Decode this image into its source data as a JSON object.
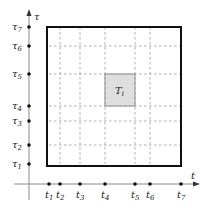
{
  "diagram": {
    "x_axis": {
      "label": "t",
      "ticks": [
        {
          "name": "t",
          "sub": "1",
          "x": 49
        },
        {
          "name": "t",
          "sub": "2",
          "x": 60
        },
        {
          "name": "t",
          "sub": "3",
          "x": 80
        },
        {
          "name": "t",
          "sub": "4",
          "x": 105
        },
        {
          "name": "t",
          "sub": "5",
          "x": 135
        },
        {
          "name": "t",
          "sub": "6",
          "x": 150
        },
        {
          "name": "t",
          "sub": "7",
          "x": 181
        }
      ]
    },
    "y_axis": {
      "label": "τ",
      "ticks": [
        {
          "name": "τ",
          "sub": "1",
          "y": 164
        },
        {
          "name": "τ",
          "sub": "2",
          "y": 145
        },
        {
          "name": "τ",
          "sub": "3",
          "y": 121
        },
        {
          "name": "τ",
          "sub": "4",
          "y": 106
        },
        {
          "name": "τ",
          "sub": "5",
          "y": 74
        },
        {
          "name": "τ",
          "sub": "6",
          "y": 46
        },
        {
          "name": "τ",
          "sub": "7",
          "y": 27
        }
      ]
    },
    "region": {
      "x0": 49,
      "y0": 27,
      "x1": 181,
      "y1": 164
    },
    "highlight": {
      "label": "T",
      "sub": "i",
      "x0": 105,
      "y0": 74,
      "x1": 135,
      "y1": 106,
      "fill": "#dedede"
    },
    "colors": {
      "axis": "#888888",
      "box": "#111111",
      "grid": "#9a9a9a",
      "dot": "#111111"
    }
  }
}
